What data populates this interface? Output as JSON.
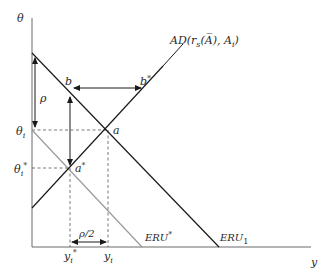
{
  "diagram": {
    "axes": {
      "y_label": "θ",
      "x_label": "y"
    },
    "curves": {
      "ad": {
        "label_main": "AD(r",
        "label_sub": "s",
        "label_mid": "(A̅), A",
        "label_sub2": "i",
        "label_end": ")",
        "color": "#1a1a1a"
      },
      "eru1": {
        "label_main": "ERU",
        "label_sub": "1",
        "color": "#1a1a1a"
      },
      "eru_star": {
        "label_main": "ERU",
        "label_sup": "*",
        "color": "#9a9a9a"
      }
    },
    "points": {
      "a": "a",
      "a_star": "a",
      "a_star_sup": "*",
      "b": "b",
      "b_star": "b",
      "b_star_sup": "*"
    },
    "ticks": {
      "theta_i": "θ",
      "theta_i_sub": "i",
      "theta_i_star": "θ",
      "theta_i_star_sub": "i",
      "theta_i_star_sup": "*",
      "y_i": "y",
      "y_i_sub": "i",
      "y_i_star": "y",
      "y_i_star_sub": "i",
      "y_i_star_sup": "*"
    },
    "annotations": {
      "rho": "ρ",
      "rho_half": "ρ/2"
    }
  }
}
